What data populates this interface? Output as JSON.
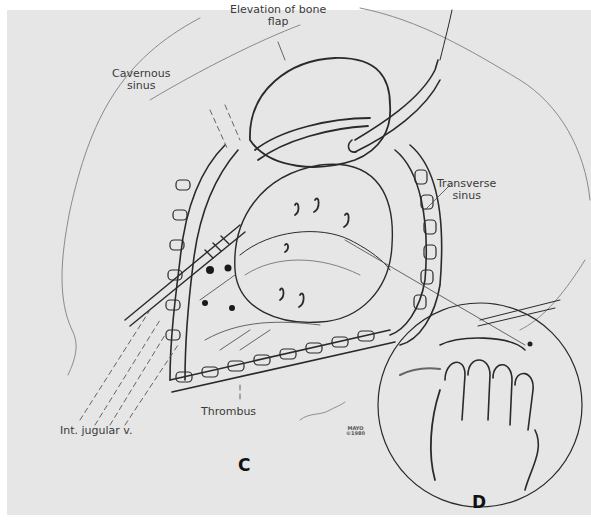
{
  "figure": {
    "type": "surgical illustration",
    "style": "grayscale pencil drawing",
    "colors": {
      "background": "#e6e6e6",
      "border": "#ffffff",
      "ink": "#2a2a2a",
      "label": "#3a3a3a"
    }
  },
  "labels": {
    "bone_flap_line1": "Elevation of bone",
    "bone_flap_line2": "flap",
    "cavernous_line1": "Cavernous",
    "cavernous_line2": "sinus",
    "transverse_line1": "Transverse",
    "transverse_line2": "sinus",
    "thrombus": "Thrombus",
    "jugular": "Int. jugular v."
  },
  "panels": {
    "main": "C",
    "inset": "D"
  },
  "signature": {
    "line1": "MAYO",
    "line2": "©1980"
  }
}
